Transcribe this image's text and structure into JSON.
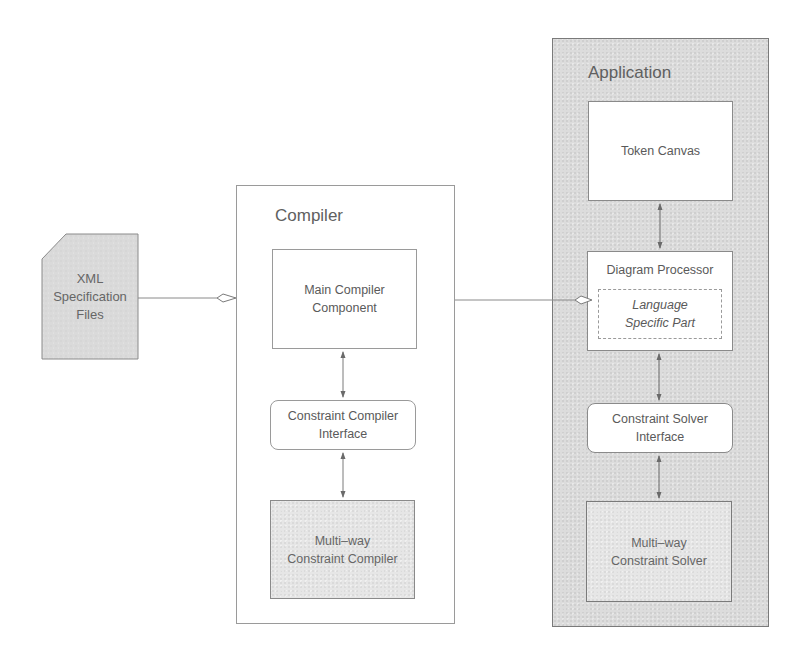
{
  "diagram": {
    "xml_files": {
      "label_lines": [
        "XML",
        "Specification",
        "Files"
      ]
    },
    "compiler": {
      "title": "Compiler",
      "main_component": {
        "label_lines": [
          "Main Compiler",
          "Component"
        ]
      },
      "constraint_interface": {
        "label_lines": [
          "Constraint Compiler",
          "Interface"
        ]
      },
      "multiway": {
        "label_lines": [
          "Multi–way",
          "Constraint Compiler"
        ]
      }
    },
    "application": {
      "title": "Application",
      "token_canvas": {
        "label": "Token Canvas"
      },
      "diagram_processor": {
        "label": "Diagram Processor",
        "language_part": {
          "label_lines": [
            "Language",
            "Specific Part"
          ]
        }
      },
      "constraint_interface": {
        "label_lines": [
          "Constraint Solver",
          "Interface"
        ]
      },
      "multiway": {
        "label_lines": [
          "Multi–way",
          "Constraint Solver"
        ]
      }
    },
    "colors": {
      "line": "#7a7a7a",
      "text": "#5a5a5a",
      "app_fill": "#dcdcdc",
      "component_fill": "#ffffff",
      "multiway_fill": "#e6e6e6"
    }
  }
}
